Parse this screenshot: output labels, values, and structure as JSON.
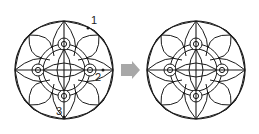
{
  "figure": {
    "left_pattern": {
      "center": [
        64,
        70
      ],
      "radius": 49,
      "labels": [
        {
          "text": "1",
          "x": 91,
          "y": 24,
          "point": [
            88,
            28
          ]
        },
        {
          "text": "2",
          "x": 96,
          "y": 80,
          "point": [
            103,
            70
          ]
        },
        {
          "text": "3",
          "x": 57,
          "y": 114,
          "point": [
            64,
            117
          ]
        }
      ]
    },
    "arrow": {
      "color": "#a8a8a8",
      "direction": "right"
    },
    "right_pattern": {
      "center": [
        196,
        70
      ],
      "radius": 49
    },
    "stroke_color": "#1a1a1a"
  }
}
